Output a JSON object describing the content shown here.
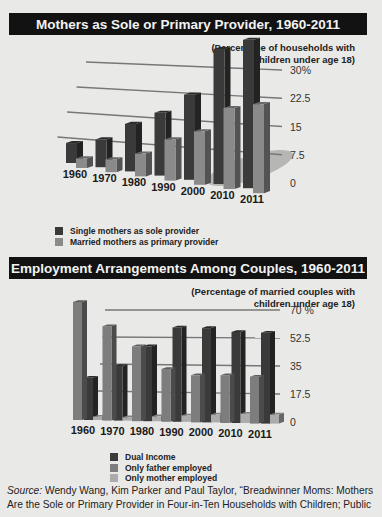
{
  "source": {
    "label": "Source:",
    "text": "Wendy Wang, Kim Parker and Paul Taylor, “Breadwinner Moms: Mothers Are the Sole or Primary Provider in Four-in-Ten Households with Children; Public"
  },
  "colors": {
    "background": "#e9e9e7",
    "title_bar": "#121212",
    "dark_bar": "#3a3a3a",
    "medium_bar": "#7d7d7d",
    "light_bar": "#a9a9a9"
  },
  "chart_data": [
    {
      "type": "bar",
      "title": "Mothers as Sole or Primary Provider, 1960-2011",
      "subtitle": "(Percentage of households with children under age 18)",
      "xlabel": "",
      "ylabel": "",
      "categories": [
        "1960",
        "1970",
        "1980",
        "1990",
        "2000",
        "2010",
        "2011"
      ],
      "series": [
        {
          "name": "Single mothers as sole provider",
          "color": "#3a3a3a",
          "values": [
            7.3,
            8.5,
            12.5,
            14.5,
            17.5,
            25,
            25
          ]
        },
        {
          "name": "Married mothers as primary provider",
          "color": "#8a8a8a",
          "values": [
            3.5,
            3.9,
            6,
            9.5,
            11,
            15,
            15
          ]
        }
      ],
      "ylim": [
        0,
        30
      ],
      "yticks": [
        "0",
        "7.5",
        "15",
        "22.5",
        "30%"
      ],
      "grid": true,
      "legend_position": "bottom-left",
      "style": "3d-perspective"
    },
    {
      "type": "bar",
      "title": "Employment Arrangements Among Couples, 1960-2011",
      "subtitle": "(Percentage of married couples with children under age 18)",
      "xlabel": "",
      "ylabel": "",
      "categories": [
        "1960",
        "1970",
        "1980",
        "1990",
        "2000",
        "2010",
        "2011"
      ],
      "series": [
        {
          "name": "Dual Income",
          "color": "#3a3a3a",
          "values": [
            25,
            33,
            46,
            59,
            60,
            59,
            60
          ]
        },
        {
          "name": "Only father employed",
          "color": "#7d7d7d",
          "values": [
            70,
            57,
            46,
            33,
            30,
            31,
            31
          ]
        },
        {
          "name": "Only mother employed",
          "color": "#ababab",
          "values": [
            2,
            2,
            3,
            4,
            5,
            6,
            6
          ]
        }
      ],
      "ylim": [
        0,
        70
      ],
      "yticks": [
        "0",
        "17.5",
        "35",
        "52.5",
        "70 %"
      ],
      "grid": true,
      "legend_position": "bottom-center",
      "style": "3d-perspective"
    }
  ]
}
